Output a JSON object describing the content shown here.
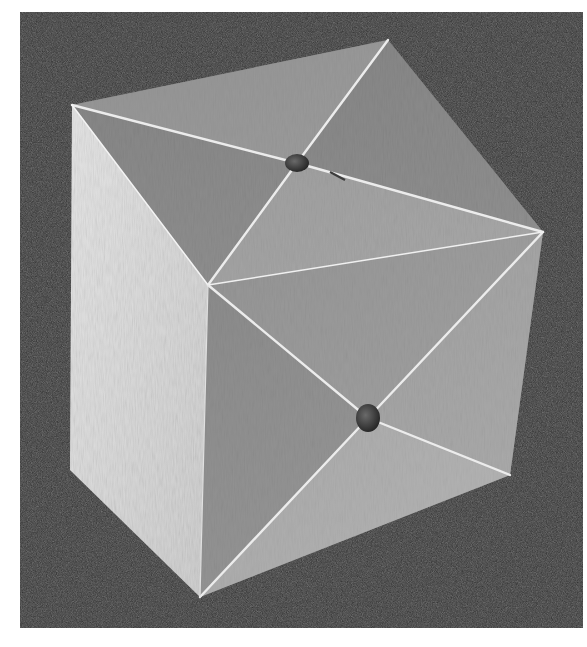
{
  "image": {
    "description": "Black-and-white photograph of a wooden cube assembled from six square pyramids; light seam lines run from each face's center to its corners, with a small dowel peg at the center of two visible faces",
    "background_color": "#2b2b2b",
    "page_color": "#ffffff",
    "colors": {
      "top_face": "#8f8f8f",
      "left_face": "#dcdcdc",
      "front_face": "#9a9a9a",
      "seam": "#e8e8e8",
      "peg": "#3a3a3a"
    },
    "cube": {
      "vertices": {
        "top_left": [
          72,
          105
        ],
        "top_back": [
          388,
          40
        ],
        "right": [
          543,
          232
        ],
        "center": [
          208,
          285
        ],
        "left_bottom": [
          70,
          470
        ],
        "bottom_front": [
          200,
          597
        ],
        "bottom_right": [
          510,
          475
        ]
      },
      "pegs": [
        {
          "face": "top",
          "center": [
            297,
            163
          ]
        },
        {
          "face": "front-right",
          "center": [
            368,
            418
          ]
        }
      ]
    }
  }
}
